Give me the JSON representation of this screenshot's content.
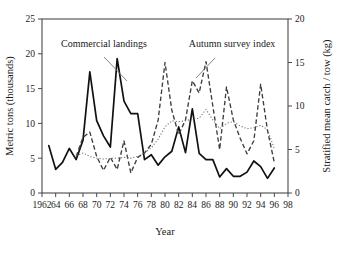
{
  "chart_data": {
    "type": "line",
    "title": "",
    "xlabel": "Year",
    "ylabel": "Metric tons (thousands)",
    "y2label": "Stratified mean catch / tow (kg)",
    "xlim": [
      1962,
      1998
    ],
    "ylim": [
      0,
      25
    ],
    "y2lim": [
      0,
      20
    ],
    "xticks": [
      1962,
      1964,
      1966,
      1968,
      1970,
      1972,
      1974,
      1976,
      1978,
      1980,
      1982,
      1984,
      1986,
      1988,
      1990,
      1992,
      1994,
      1996,
      1998
    ],
    "xtick_labels": [
      "1962",
      "64",
      "66",
      "68",
      "70",
      "72",
      "74",
      "76",
      "78",
      "80",
      "82",
      "84",
      "86",
      "88",
      "90",
      "92",
      "94",
      "96",
      "98"
    ],
    "yticks": [
      0,
      5,
      10,
      15,
      20,
      25
    ],
    "ytick_labels": [
      "0",
      "5",
      "10",
      "15",
      "20",
      "25"
    ],
    "y2ticks": [
      0,
      5,
      10,
      15,
      20
    ],
    "y2tick_labels": [
      "0",
      "5",
      "10",
      "15",
      "20"
    ],
    "grid": false,
    "legend": "annotations",
    "annotations": [
      {
        "text": "Commercial landings",
        "x": 1968.0,
        "y": 23.1
      },
      {
        "text": "Autumn survey index",
        "x": 1980.6,
        "y": 23.1
      }
    ],
    "series": [
      {
        "name": "Commercial landings",
        "axis": "left",
        "style": "solid",
        "x": [
          1963,
          1964,
          1965,
          1966,
          1967,
          1968,
          1969,
          1970,
          1971,
          1972,
          1973,
          1974,
          1975,
          1976,
          1977,
          1978,
          1979,
          1980,
          1981,
          1982,
          1983,
          1984,
          1985,
          1986,
          1987,
          1988,
          1989,
          1990,
          1991,
          1992,
          1993,
          1994,
          1995,
          1996
        ],
        "values": [
          6.8,
          3.4,
          4.4,
          6.4,
          4.8,
          7.6,
          17.4,
          10.4,
          8.2,
          6.6,
          19.3,
          13.2,
          11.4,
          11.4,
          4.8,
          5.5,
          4.0,
          5.2,
          6.0,
          9.5,
          5.8,
          12.1,
          5.7,
          4.8,
          4.8,
          2.3,
          3.5,
          2.4,
          2.4,
          3.0,
          4.6,
          3.8,
          2.1,
          3.6
        ]
      },
      {
        "name": "Autumn survey index",
        "axis": "right",
        "style": "dashed",
        "x": [
          1967,
          1968,
          1969,
          1970,
          1971,
          1972,
          1973,
          1974,
          1975,
          1976,
          1977,
          1978,
          1979,
          1980,
          1981,
          1982,
          1983,
          1984,
          1985,
          1986,
          1987,
          1988,
          1989,
          1990,
          1991,
          1992,
          1993,
          1994,
          1995,
          1996
        ],
        "values": [
          4.2,
          6.4,
          7.0,
          4.2,
          2.6,
          4.1,
          2.7,
          6.0,
          2.3,
          4.1,
          4.6,
          5.6,
          8.4,
          15.0,
          9.5,
          6.7,
          8.4,
          12.9,
          11.5,
          15.1,
          10.0,
          5.0,
          12.2,
          8.4,
          6.3,
          4.5,
          6.0,
          12.5,
          7.2,
          3.5
        ]
      },
      {
        "name": "Smoothed survey trend",
        "axis": "right",
        "style": "dotted",
        "x": [
          1967,
          1968,
          1969,
          1970,
          1971,
          1972,
          1973,
          1974,
          1975,
          1976,
          1977,
          1978,
          1979,
          1980,
          1981,
          1982,
          1983,
          1984,
          1985,
          1986,
          1987,
          1988,
          1989,
          1990,
          1991,
          1992,
          1993,
          1994,
          1995,
          1996
        ],
        "values": [
          4.3,
          4.6,
          4.2,
          4.0,
          3.9,
          4.0,
          4.0,
          4.1,
          4.0,
          4.2,
          4.6,
          5.2,
          6.2,
          7.6,
          8.3,
          8.2,
          8.3,
          8.5,
          8.6,
          9.6,
          8.4,
          7.4,
          8.0,
          8.2,
          7.7,
          7.4,
          7.5,
          7.8,
          7.3,
          5.1
        ]
      }
    ]
  }
}
